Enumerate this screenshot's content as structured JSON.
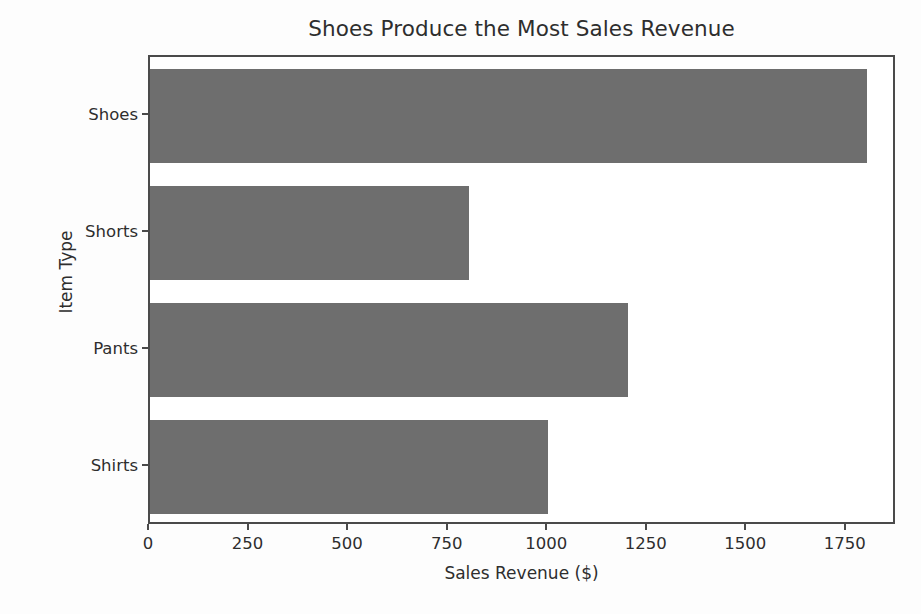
{
  "chart_data": {
    "type": "bar",
    "orientation": "horizontal",
    "title": "Shoes Produce the Most Sales Revenue",
    "xlabel": "Sales Revenue ($)",
    "ylabel": "Item Type",
    "categories": [
      "Shirts",
      "Pants",
      "Shorts",
      "Shoes"
    ],
    "values": [
      1000,
      1200,
      800,
      1800
    ],
    "xticks": [
      0,
      250,
      500,
      750,
      1000,
      1250,
      1500,
      1750
    ],
    "xticklabels": [
      "0",
      "250",
      "500",
      "750",
      "1000",
      "1250",
      "1500",
      "1750"
    ],
    "xlim": [
      0,
      1876
    ],
    "grid": false,
    "legend": null,
    "bar_color": "#6e6e6e",
    "axes_color": "#4a4a4a",
    "text_color": "#2e2e2e",
    "background": "#ffffff"
  }
}
